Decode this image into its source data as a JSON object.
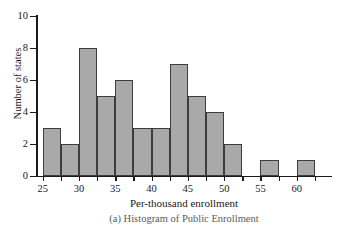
{
  "figure": {
    "caption": "(a) Histogram of Public Enrollment"
  },
  "chart_data": {
    "type": "bar",
    "title": "",
    "subtitle": "",
    "xlabel": "Per-thousand enrollment",
    "ylabel": "Number of states",
    "xlim": [
      23.5,
      64
    ],
    "ylim": [
      0,
      10
    ],
    "grid": false,
    "legend": null,
    "bin_width": 2.5,
    "x_ticks": [
      25,
      30,
      35,
      40,
      45,
      50,
      55,
      60
    ],
    "x_tick_labels": [
      "25",
      "30",
      "35",
      "40",
      "45",
      "50",
      "55",
      "60"
    ],
    "y_ticks": [
      0,
      2,
      4,
      6,
      8,
      10
    ],
    "y_tick_labels": [
      "0",
      "2",
      "4",
      "6",
      "8",
      "10"
    ],
    "bins": [
      {
        "start": 25.0,
        "end": 27.5,
        "label": "25.0-27.5",
        "value": 3
      },
      {
        "start": 27.5,
        "end": 30.0,
        "label": "27.5-30.0",
        "value": 2
      },
      {
        "start": 30.0,
        "end": 32.5,
        "label": "30.0-32.5",
        "value": 8
      },
      {
        "start": 32.5,
        "end": 35.0,
        "label": "32.5-35.0",
        "value": 5
      },
      {
        "start": 35.0,
        "end": 37.5,
        "label": "35.0-37.5",
        "value": 6
      },
      {
        "start": 37.5,
        "end": 40.0,
        "label": "37.5-40.0",
        "value": 3
      },
      {
        "start": 40.0,
        "end": 42.5,
        "label": "40.0-42.5",
        "value": 3
      },
      {
        "start": 42.5,
        "end": 45.0,
        "label": "42.5-45.0",
        "value": 7
      },
      {
        "start": 45.0,
        "end": 47.5,
        "label": "45.0-47.5",
        "value": 5
      },
      {
        "start": 47.5,
        "end": 50.0,
        "label": "47.5-50.0",
        "value": 4
      },
      {
        "start": 50.0,
        "end": 52.5,
        "label": "50.0-52.5",
        "value": 2
      },
      {
        "start": 52.5,
        "end": 55.0,
        "label": "52.5-55.0",
        "value": 0
      },
      {
        "start": 55.0,
        "end": 57.5,
        "label": "55.0-57.5",
        "value": 1
      },
      {
        "start": 57.5,
        "end": 60.0,
        "label": "57.5-60.0",
        "value": 0
      },
      {
        "start": 60.0,
        "end": 62.5,
        "label": "60.0-62.5",
        "value": 1
      }
    ],
    "categories": [
      "25.0-27.5",
      "27.5-30.0",
      "30.0-32.5",
      "32.5-35.0",
      "35.0-37.5",
      "37.5-40.0",
      "40.0-42.5",
      "42.5-45.0",
      "45.0-47.5",
      "47.5-50.0",
      "50.0-52.5",
      "52.5-55.0",
      "55.0-57.5",
      "57.5-60.0",
      "60.0-62.5"
    ],
    "values": [
      3,
      2,
      8,
      5,
      6,
      3,
      3,
      7,
      5,
      4,
      2,
      0,
      1,
      0,
      1
    ],
    "colors": {
      "bar_fill": "#a9a9a9",
      "bar_border": "#3d3d3d",
      "axis": "#1a1a1a",
      "background": "#ffffff"
    }
  }
}
